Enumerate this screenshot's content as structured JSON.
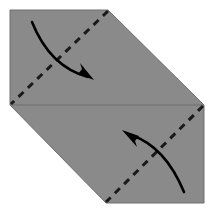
{
  "figure": {
    "type": "origami-instruction-diagram",
    "background_color": "#ffffff",
    "canvas": {
      "width": 213,
      "height": 213
    }
  },
  "paper": {
    "name": "folded-paper-sheet",
    "fill_color": "#8a8a8a",
    "outline_color": "#6f6f6f",
    "outline_width": 1,
    "shape": "hexagon",
    "vertices": [
      {
        "label": "top-left",
        "x": 10,
        "y": 10
      },
      {
        "label": "top-right",
        "x": 108,
        "y": 10
      },
      {
        "label": "right",
        "x": 204,
        "y": 105
      },
      {
        "label": "bottom-right",
        "x": 204,
        "y": 203
      },
      {
        "label": "bottom-left",
        "x": 106,
        "y": 203
      },
      {
        "label": "left",
        "x": 10,
        "y": 105
      }
    ],
    "points_path": "10,10 108,10 204,105 204,203 106,203 10,105"
  },
  "horizontal_crease": {
    "name": "horizontal-edge-line",
    "style": "solid",
    "color": "#6f6f6f",
    "width": 1,
    "x1": 10,
    "y1": 105,
    "x2": 204,
    "y2": 105
  },
  "fold_lines": [
    {
      "name": "upper-fold-line",
      "style": "dashed",
      "color": "#1a1a1a",
      "width": 3,
      "dash_pattern": "7 6",
      "x1": 108,
      "y1": 11,
      "x2": 11,
      "y2": 104,
      "meaning": "valley fold"
    },
    {
      "name": "lower-fold-line",
      "style": "dashed",
      "color": "#1a1a1a",
      "width": 3,
      "dash_pattern": "7 6",
      "x1": 203,
      "y1": 106,
      "x2": 106,
      "y2": 202,
      "meaning": "valley fold"
    }
  ],
  "arrows": [
    {
      "name": "upper-fold-arrow",
      "color": "#000000",
      "width": 2.6,
      "direction": "down-right",
      "start": {
        "x": 32,
        "y": 22
      },
      "end": {
        "x": 88,
        "y": 77
      },
      "control1": {
        "x": 44,
        "y": 52
      },
      "control2": {
        "x": 62,
        "y": 70
      },
      "path": "M 32 22 C 44 52 62 70 88 77",
      "head_points": "94,80 78,74 82,69 80,63"
    },
    {
      "name": "lower-fold-arrow",
      "color": "#000000",
      "width": 2.6,
      "direction": "up-left",
      "start": {
        "x": 184,
        "y": 192
      },
      "end": {
        "x": 131,
        "y": 135
      },
      "control1": {
        "x": 172,
        "y": 163
      },
      "control2": {
        "x": 155,
        "y": 143
      },
      "path": "M 184 192 C 172 163 155 143 131 135",
      "head_points": "122,130 139,136 135,141 137,147"
    }
  ],
  "labels": {
    "step_caption": "",
    "notes": ""
  }
}
